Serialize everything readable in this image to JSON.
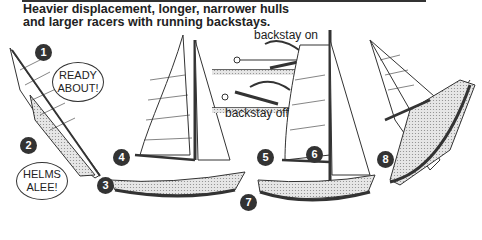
{
  "caption": {
    "line1": "Heavier displacement, longer, narrower hulls",
    "line2": "and larger racers with running backstays."
  },
  "inset": {
    "label_on": "backstay on",
    "label_off": "backstay off"
  },
  "callouts": {
    "bubble1": "READY ABOUT!",
    "bubble2": "HELMS ALEE!"
  },
  "markers": [
    "1",
    "2",
    "3",
    "4",
    "5",
    "6",
    "7",
    "8"
  ],
  "colors": {
    "ink": "#333333",
    "hull": "#d8d8d8",
    "paper": "#ffffff"
  }
}
